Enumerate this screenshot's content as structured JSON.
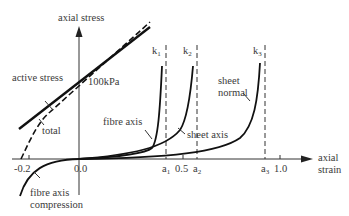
{
  "diagram": {
    "y_axis_label": "axial stress",
    "x_axis_label_line1": "axial",
    "x_axis_label_line2": "strain",
    "annotation_100kpa": "100kPa",
    "labels": {
      "active_stress": "active stress",
      "total": "total",
      "fibre_axis": "fibre axis",
      "sheet_axis": "sheet axis",
      "sheet_normal_line1": "sheet",
      "sheet_normal_line2": "normal",
      "fibre_axis_compression_line1": "fibre axis",
      "fibre_axis_compression_line2": "compression"
    },
    "curve_tags": {
      "k1": "k",
      "k1_sub": "1",
      "k2": "k",
      "k2_sub": "2",
      "k3": "k",
      "k3_sub": "3"
    },
    "x_ticks": {
      "neg02": "-0.2",
      "zero": "0.0",
      "a1": "a",
      "a1_sub": "1",
      "half": "0.5",
      "a2": "a",
      "a2_sub": "2",
      "a3": "a",
      "a3_sub": "3",
      "one": "1.0"
    },
    "colors": {
      "line": "#1a1a1a",
      "text": "#3a3a3a",
      "background": "#ffffff"
    }
  }
}
